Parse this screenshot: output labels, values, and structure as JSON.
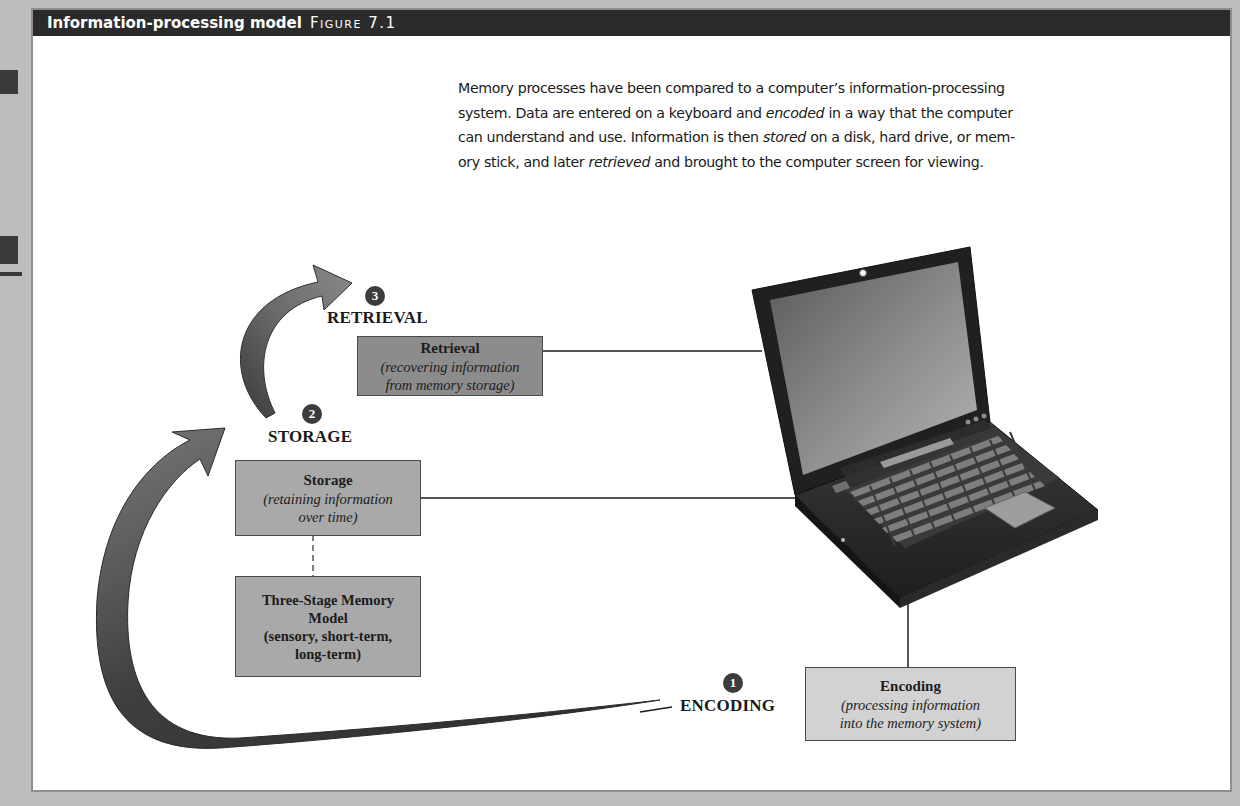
{
  "figure": {
    "title": "Information-processing model",
    "figure_label": "Figure 7.1"
  },
  "intro": {
    "line1": "Memory processes have been compared to a computer’s information-processing",
    "line2_a": "system. Data are entered on a keyboard and ",
    "line2_em": "encoded",
    "line2_b": " in a way that the computer",
    "line3_a": "can understand and use. Information is then ",
    "line3_em": "stored",
    "line3_b": " on a disk, hard drive, or mem-",
    "line4_a": "ory stick, and later ",
    "line4_em": "retrieved",
    "line4_b": " and brought to the computer screen for viewing."
  },
  "stages": {
    "encoding": {
      "number": "1",
      "label": "ENCODING",
      "box_title": "Encoding",
      "box_desc_1": "(processing information",
      "box_desc_2": "into the memory system)"
    },
    "storage": {
      "number": "2",
      "label": "STORAGE",
      "box_title": "Storage",
      "box_desc_1": "(retaining information",
      "box_desc_2": "over time)"
    },
    "retrieval": {
      "number": "3",
      "label": "RETRIEVAL",
      "box_title": "Retrieval",
      "box_desc_1": "(recovering information",
      "box_desc_2": "from memory storage)"
    }
  },
  "model_box": {
    "line1": "Three-Stage Memory",
    "line2": "Model",
    "line3": "(sensory, short-term,",
    "line4": "long-term)"
  },
  "colors": {
    "header_bg": "#2b2b2b",
    "page_bg": "#bdbdbd",
    "retrieval_box": "#8c8c8c",
    "storage_box": "#a9a9a9",
    "encoding_box": "#d2d2d2",
    "badge": "#3c3c3c"
  },
  "illustration": {
    "subject": "laptop-computer"
  }
}
